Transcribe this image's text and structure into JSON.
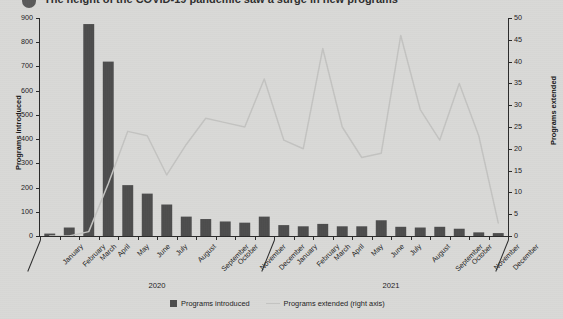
{
  "title": {
    "bullet": "bullet-marker",
    "text": "The height of the COVID-19 pandemic saw a surge in new programs"
  },
  "legend": {
    "position": "bottom-center",
    "items": [
      {
        "label": "Programs introduced",
        "marker": "square",
        "color": "#4d4d4d"
      },
      {
        "label": "Programs extended (right axis)",
        "marker": "line",
        "color": "#c3c3c1"
      }
    ]
  },
  "axes": {
    "left": {
      "title": "Programs introduced",
      "min": 0,
      "max": 900,
      "step": 100,
      "ticks": [
        "0",
        "100",
        "200",
        "300",
        "400",
        "500",
        "600",
        "700",
        "800",
        "900"
      ]
    },
    "right": {
      "title": "Programs extended",
      "min": 0,
      "max": 50,
      "step": 5,
      "ticks": [
        "0",
        "5",
        "10",
        "15",
        "20",
        "25",
        "30",
        "35",
        "40",
        "45",
        "50"
      ]
    }
  },
  "year_groups": [
    {
      "label": "2020",
      "start": 0,
      "end": 11
    },
    {
      "label": "2021",
      "start": 12,
      "end": 23
    }
  ],
  "colors": {
    "background": "#d9d9d7",
    "bar": "#4d4d4d",
    "line": "#c3c3c1",
    "axis": "#2a2a2a",
    "text": "#1c1c1c"
  },
  "chart_data": {
    "type": "bar",
    "title": "The height of the COVID-19 pandemic saw a surge in new programs",
    "xlabel": "",
    "ylabel": "Programs introduced",
    "y2label": "Programs extended",
    "ylim": [
      0,
      900
    ],
    "y2lim": [
      0,
      50
    ],
    "grid": false,
    "legend_position": "bottom-center",
    "categories": [
      "January",
      "February",
      "March",
      "April",
      "May",
      "June",
      "July",
      "August",
      "September",
      "October",
      "November",
      "December",
      "January",
      "February",
      "March",
      "April",
      "May",
      "June",
      "July",
      "August",
      "September",
      "October",
      "November",
      "December"
    ],
    "series": [
      {
        "name": "Programs introduced",
        "axis": "left",
        "type": "bar",
        "color": "#4d4d4d",
        "values": [
          10,
          35,
          875,
          720,
          210,
          175,
          130,
          80,
          70,
          60,
          55,
          80,
          45,
          40,
          50,
          40,
          40,
          65,
          38,
          35,
          38,
          30,
          15,
          12
        ]
      },
      {
        "name": "Programs extended (right axis)",
        "axis": "right",
        "type": "line",
        "color": "#c3c3c1",
        "values": [
          0,
          0,
          1,
          12,
          24,
          23,
          14,
          21,
          27,
          26,
          25,
          36,
          22,
          20,
          43,
          25,
          18,
          19,
          46,
          29,
          22,
          35,
          23,
          3
        ]
      }
    ]
  }
}
